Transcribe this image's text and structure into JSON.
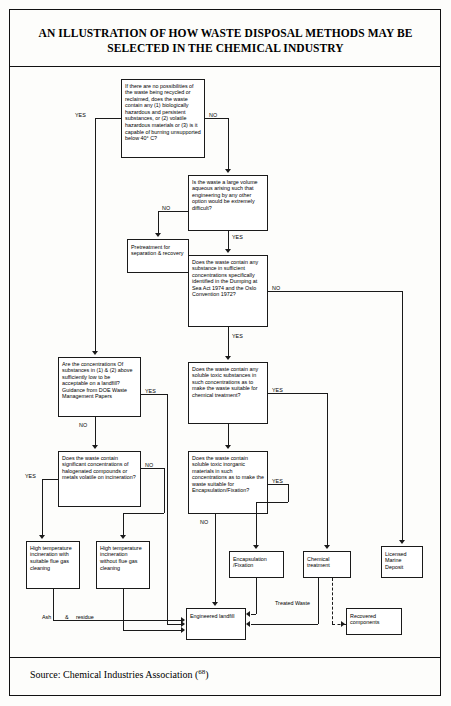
{
  "document": {
    "title": "AN ILLUSTRATION OF HOW WASTE DISPOSAL METHODS MAY BE SELECTED IN THE CHEMICAL INDUSTRY",
    "source": "Source: Chemical Industries Association (",
    "source_ref": "68",
    "source_close": ")"
  },
  "flowchart": {
    "type": "flowchart",
    "nodes": {
      "q1": "If there are no possibilities of the waste being recycled or reclaimed, does the waste contain any (1) biologically hazardous and persistent substances, or (2) volatile hazardous materials or (3) is it capable of burning unsupported below 40° C?",
      "q2": "Is the waste a large volume aqueous arising such that engineering by any other option would be extremely difficult?",
      "pretreatment": "Pretreatment for separation & recovery",
      "q3": "Does the waste contain any substance in sufficient concentrations specifically identified in the Dumping at Sea Act 1974 and the Oslo Convention 1972?",
      "q4": "Are the concentrations Of substances in (1) & (2) above sufficiently low to be acceptable on a landfill? Guidance from DOE Waste Management Papers",
      "q5": "Does the waste contain any soluble toxic substances in such concentrations as to make the waste suitable for chemical treatment?",
      "q6": "Does the waste contain significant concentrations of halogenated compounds or metals volatile on incineration?",
      "q7": "Does the waste contain soluble toxic inorganic materials in such concentrations as to make the waste suitable for Encapsulation/Fixation?",
      "incin_with": "High temperature incineration with suitable flue gas cleaning",
      "incin_without": "High temperature incineration without flue gas cleaning",
      "encapsulation": "Encapsulation /Fixation",
      "chemical_treatment": "Chemical treatment",
      "marine_deposit": "Licensed Marine Deposit",
      "engineered_landfill": "Engineered landfill",
      "recovered": "Recovered components"
    },
    "edge_labels": {
      "yes": "YES",
      "no": "NO",
      "q1_yes": "YES",
      "q1_no": "NO",
      "q2_no": "NO",
      "q2_yes": "YES",
      "q3_no": "NO",
      "q3_yes": "YES",
      "q4_yes": "YES",
      "q4_no": "NO",
      "q5_yes": "YES",
      "q6_no": "NO",
      "q6_yes": "YES",
      "q7_yes": "YES",
      "q7_no": "NO",
      "ash": "Ash",
      "amp": "&",
      "residue": "residue",
      "treated_waste": "Treated Waste"
    }
  }
}
